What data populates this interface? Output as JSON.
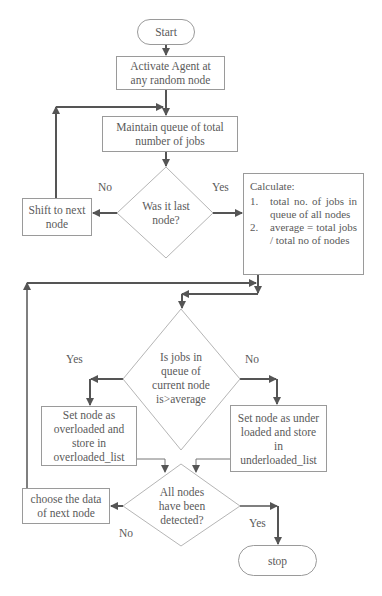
{
  "flowchart": {
    "start": "Start",
    "activate": "Activate Agent at any random node",
    "maintain_queue": "Maintain queue of total number of jobs",
    "decision_last_node": "Was it last node?",
    "shift_next": "Shift to next node",
    "calculate": {
      "title": "Calculate:",
      "steps": [
        {
          "num": "1.",
          "text": "total no. of jobs in queue of all nodes"
        },
        {
          "num": "2.",
          "text": "average = total jobs / total no of nodes"
        }
      ]
    },
    "decision_above_average": "Is jobs in queue of current node is>average",
    "overloaded": "Set node as overloaded and store in overloaded_list",
    "underloaded": "Set node as under loaded and store in underloaded_list",
    "decision_all_detected": "All nodes have been detected?",
    "choose_next": "choose the data of next node",
    "stop": "stop",
    "labels": {
      "no_1": "No",
      "yes_1": "Yes",
      "yes_2": "Yes",
      "no_2": "No",
      "no_3": "No",
      "yes_3": "Yes"
    }
  },
  "colors": {
    "line": "#555555",
    "border": "#9a9a9a",
    "text": "#5a5a5a"
  }
}
